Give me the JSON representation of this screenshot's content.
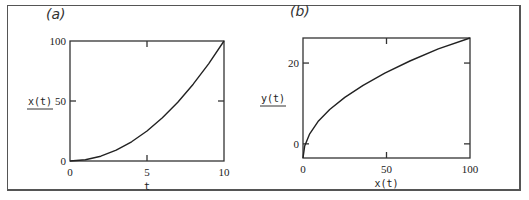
{
  "chart_data": [
    {
      "type": "line",
      "panel_label": "(a)",
      "xlabel": "t",
      "ylabel": "x(t)",
      "xlim": [
        0,
        10
      ],
      "ylim": [
        0,
        100
      ],
      "xticks": [
        0,
        5,
        10
      ],
      "yticks": [
        0,
        50,
        100
      ],
      "grid": false,
      "series": [
        {
          "name": "x(t)",
          "x": [
            0,
            1,
            2,
            3,
            4,
            5,
            6,
            7,
            8,
            9,
            10
          ],
          "y": [
            0,
            1,
            4,
            9,
            16,
            25,
            36,
            49,
            64,
            81,
            100
          ]
        }
      ]
    },
    {
      "type": "line",
      "panel_label": "(b)",
      "xlabel": "x(t)",
      "ylabel": "y(t)",
      "xlim": [
        0,
        100
      ],
      "ylim": [
        -3.5,
        26.2
      ],
      "xticks": [
        0,
        50,
        100
      ],
      "yticks": [
        0,
        20
      ],
      "grid": false,
      "series": [
        {
          "name": "y(t) vs x(t)",
          "x": [
            0,
            1,
            4,
            9,
            16,
            25,
            36,
            49,
            64,
            81,
            100
          ],
          "y": [
            -3.5,
            -0.5,
            2.5,
            5.5,
            8.5,
            11.5,
            14.5,
            17.5,
            20.5,
            23.5,
            26.2
          ]
        }
      ]
    }
  ],
  "layout": [
    {
      "box": [
        70,
        41,
        224,
        161
      ]
    },
    {
      "box": [
        303,
        38,
        470,
        158
      ]
    }
  ]
}
